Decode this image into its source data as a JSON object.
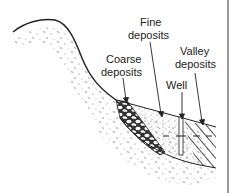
{
  "labels": {
    "fine_line1": "Fine",
    "fine_line2": "deposits",
    "coarse_line1": "Coarse",
    "coarse_line2": "deposits",
    "valley_line1": "Valley",
    "valley_line2": "deposits",
    "well": "Well"
  },
  "colors": {
    "ink": "#222222",
    "speckle": "#b5b5b5",
    "frame": "#555555"
  }
}
